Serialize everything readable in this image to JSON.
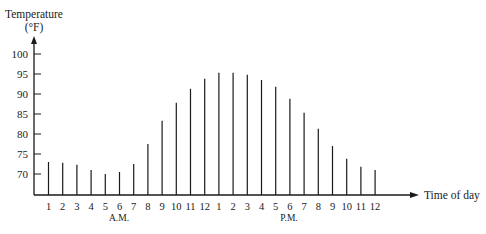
{
  "chart_data": {
    "type": "bar",
    "title": "",
    "ylabel": "Temperature",
    "ylabel_unit": "(°F)",
    "xlabel": "Time of day",
    "ylim": [
      65,
      100
    ],
    "yticks": [
      70,
      75,
      80,
      85,
      90,
      95,
      100
    ],
    "period_labels": [
      "A.M.",
      "P.M."
    ],
    "categories": [
      "1",
      "2",
      "3",
      "4",
      "5",
      "6",
      "7",
      "8",
      "9",
      "10",
      "11",
      "12",
      "1",
      "2",
      "3",
      "4",
      "5",
      "6",
      "7",
      "8",
      "9",
      "10",
      "11",
      "12"
    ],
    "values": [
      73,
      72.8,
      72.3,
      71,
      70,
      70.5,
      72.5,
      77.5,
      83.3,
      87.8,
      91.3,
      93.8,
      95.3,
      95.3,
      94.8,
      93.5,
      91.8,
      88.8,
      85.3,
      81.3,
      77,
      73.8,
      71.8,
      71
    ],
    "grid": false,
    "legend": null
  },
  "colors": {
    "axis": "#1a1a1a",
    "bar": "#1a1a1a",
    "background": "#ffffff"
  }
}
